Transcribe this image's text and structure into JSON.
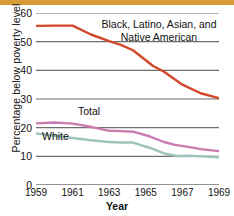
{
  "chart_data": {
    "type": "line",
    "title": "",
    "xlabel": "Year",
    "ylabel": "Percentage below poverty level",
    "x": [
      1959,
      1960,
      1961,
      1962,
      1963,
      1964,
      1965,
      1966,
      1967,
      1968,
      1969
    ],
    "xlim": [
      1959,
      1969
    ],
    "ylim": [
      0,
      60
    ],
    "yticks": [
      0,
      10,
      20,
      30,
      40,
      50,
      60
    ],
    "xticks": [
      1959,
      1961,
      1963,
      1965,
      1967,
      1969
    ],
    "grid": "horizontal",
    "legend": "inline-labels",
    "series": [
      {
        "name": "Black, Latino, Asian, and Native American",
        "color": "#d1472a",
        "values": [
          55.5,
          55.6,
          55.6,
          52.5,
          50.2,
          49.0,
          47.0,
          41.5,
          39.5,
          35.0,
          32.0,
          30.3
        ],
        "x": [
          1959,
          1960,
          1961,
          1962,
          1963,
          1963.6,
          1964.3,
          1965.4,
          1966,
          1967,
          1968,
          1969
        ]
      },
      {
        "name": "Total",
        "color": "#cc7bb0",
        "values": [
          21.5,
          21.8,
          21.4,
          20.3,
          18.9,
          18.8,
          18.6,
          17.0,
          15.0,
          14.0,
          13.2,
          12.5,
          11.8
        ],
        "x": [
          1959,
          1960,
          1961,
          1962,
          1963,
          1963.7,
          1964.3,
          1965.2,
          1966,
          1966.6,
          1967.4,
          1968,
          1969
        ]
      },
      {
        "name": "White",
        "color": "#9cc3bd",
        "values": [
          18.0,
          17.2,
          16.4,
          15.6,
          15.0,
          14.8,
          14.8,
          13.0,
          11.0,
          10.1,
          10.2,
          10.0,
          9.7
        ],
        "x": [
          1959,
          1960,
          1961,
          1962,
          1963,
          1963.6,
          1964.3,
          1965.2,
          1966,
          1966.7,
          1967.4,
          1968,
          1969
        ]
      }
    ],
    "series_labels": {
      "minority_line1": "Black, Latino, Asian, and",
      "minority_line2": "Native American",
      "total": "Total",
      "white": "White"
    },
    "ytick_labels": [
      "0",
      "10",
      "20",
      "30",
      "40",
      "50",
      "60"
    ],
    "xtick_labels": [
      "1959",
      "1961",
      "1963",
      "1965",
      "1967",
      "1969"
    ],
    "colors": {
      "minority": "#d1472a",
      "total": "#cc7bb0",
      "white": "#9cc3bd",
      "gridline": "#6e6e6e",
      "top_rule": "#d99b38"
    }
  }
}
